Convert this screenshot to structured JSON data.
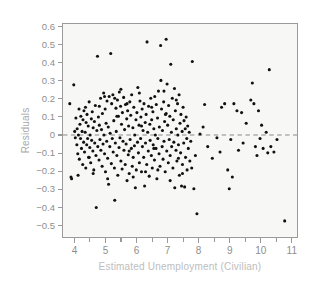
{
  "chart_data": {
    "type": "scatter",
    "title": "",
    "xlabel": "Estimated Unemployment (Civilian)",
    "ylabel": "Residuals",
    "xlim": [
      3.6,
      11.2
    ],
    "ylim": [
      -0.57,
      0.62
    ],
    "grid": false,
    "legend": null,
    "x_ticks": [
      4,
      5,
      6,
      7,
      8,
      9,
      10,
      11
    ],
    "x_tick_labels": [
      "4",
      "5",
      "6",
      "7",
      "8",
      "9",
      "10",
      "11"
    ],
    "x_minor_ticks": [
      4.5,
      5.5,
      6.5,
      7.5,
      8.5,
      9.5,
      10.5
    ],
    "y_ticks": [
      0.6,
      0.5,
      0.4,
      0.3,
      0.2,
      0.1,
      0,
      -0.1,
      -0.2,
      -0.3,
      -0.4,
      -0.5
    ],
    "y_tick_labels": [
      "0.6",
      "0.5",
      "0.4",
      "0.3",
      "0.2",
      "0.1",
      "0",
      "−0.1",
      "−0.2",
      "−0.3",
      "−0.4",
      "−0.5"
    ],
    "reference_line": {
      "name": "zero-residual-line",
      "orientation": "horizontal",
      "y": 0,
      "style": "dashed",
      "color": "#8a8a8a"
    },
    "marker": {
      "shape": "circle",
      "color": "#111111",
      "size_px": 3.1
    },
    "point_count": 286,
    "points": [
      [
        3.82,
        0.175
      ],
      [
        3.86,
        -0.235
      ],
      [
        3.88,
        -0.245
      ],
      [
        3.95,
        0.28
      ],
      [
        3.98,
        0.02
      ],
      [
        4.0,
        -0.015
      ],
      [
        4.02,
        0.095
      ],
      [
        4.05,
        -0.055
      ],
      [
        4.06,
        0.035
      ],
      [
        4.08,
        -0.105
      ],
      [
        4.1,
        0.0
      ],
      [
        4.12,
        0.145
      ],
      [
        4.13,
        -0.135
      ],
      [
        4.15,
        0.06
      ],
      [
        4.17,
        -0.02
      ],
      [
        4.18,
        0.105
      ],
      [
        4.2,
        -0.075
      ],
      [
        4.22,
        0.02
      ],
      [
        4.24,
        -0.165
      ],
      [
        4.25,
        0.085
      ],
      [
        4.27,
        -0.04
      ],
      [
        4.28,
        0.135
      ],
      [
        4.3,
        -0.095
      ],
      [
        4.32,
        0.015
      ],
      [
        4.34,
        -0.185
      ],
      [
        4.35,
        0.07
      ],
      [
        4.37,
        -0.055
      ],
      [
        4.38,
        0.115
      ],
      [
        4.4,
        -0.02
      ],
      [
        4.42,
        0.05
      ],
      [
        4.43,
        -0.125
      ],
      [
        4.45,
        0.185
      ],
      [
        4.47,
        -0.07
      ],
      [
        4.48,
        0.0
      ],
      [
        4.5,
        -0.155
      ],
      [
        4.52,
        0.09
      ],
      [
        4.53,
        -0.03
      ],
      [
        4.55,
        0.13
      ],
      [
        4.57,
        -0.09
      ],
      [
        4.58,
        0.04
      ],
      [
        4.6,
        -0.195
      ],
      [
        4.62,
        0.075
      ],
      [
        4.63,
        -0.045
      ],
      [
        4.65,
        0.165
      ],
      [
        4.67,
        -0.115
      ],
      [
        4.68,
        -0.405
      ],
      [
        4.7,
        0.025
      ],
      [
        4.72,
        0.44
      ],
      [
        4.73,
        -0.065
      ],
      [
        4.75,
        0.1
      ],
      [
        4.77,
        -0.14
      ],
      [
        4.78,
        0.055
      ],
      [
        4.8,
        -0.025
      ],
      [
        4.82,
        0.205
      ],
      [
        4.83,
        -0.085
      ],
      [
        4.85,
        0.03
      ],
      [
        4.87,
        -0.175
      ],
      [
        4.88,
        0.12
      ],
      [
        4.9,
        -0.05
      ],
      [
        4.92,
        0.235
      ],
      [
        4.93,
        0.0
      ],
      [
        4.95,
        -0.105
      ],
      [
        4.97,
        0.145
      ],
      [
        4.98,
        -0.205
      ],
      [
        5.0,
        0.065
      ],
      [
        5.02,
        -0.035
      ],
      [
        5.03,
        0.19
      ],
      [
        5.05,
        -0.13
      ],
      [
        5.07,
        0.045
      ],
      [
        5.08,
        -0.275
      ],
      [
        5.1,
        0.215
      ],
      [
        5.12,
        -0.065
      ],
      [
        5.13,
        0.01
      ],
      [
        5.15,
        0.455
      ],
      [
        5.17,
        -0.16
      ],
      [
        5.18,
        0.175
      ],
      [
        5.2,
        -0.02
      ],
      [
        5.22,
        0.225
      ],
      [
        5.23,
        -0.095
      ],
      [
        5.25,
        0.08
      ],
      [
        5.27,
        -0.185
      ],
      [
        5.28,
        0.205
      ],
      [
        5.3,
        -0.045
      ],
      [
        5.32,
        0.15
      ],
      [
        5.33,
        0.02
      ],
      [
        5.35,
        -0.115
      ],
      [
        5.37,
        0.195
      ],
      [
        5.38,
        -0.225
      ],
      [
        5.4,
        0.105
      ],
      [
        5.42,
        -0.07
      ],
      [
        5.43,
        0.24
      ],
      [
        5.45,
        -0.015
      ],
      [
        5.47,
        0.16
      ],
      [
        5.48,
        -0.145
      ],
      [
        5.5,
        0.06
      ],
      [
        5.52,
        -0.19
      ],
      [
        5.53,
        0.125
      ],
      [
        5.55,
        -0.035
      ],
      [
        5.57,
        0.21
      ],
      [
        5.58,
        -0.085
      ],
      [
        5.6,
        0.03
      ],
      [
        5.62,
        -0.165
      ],
      [
        5.63,
        0.17
      ],
      [
        5.65,
        -0.05
      ],
      [
        5.67,
        0.09
      ],
      [
        5.68,
        -0.255
      ],
      [
        5.7,
        0.135
      ],
      [
        5.72,
        -0.11
      ],
      [
        5.73,
        0.05
      ],
      [
        5.75,
        -0.215
      ],
      [
        5.77,
        0.185
      ],
      [
        5.78,
        -0.025
      ],
      [
        5.8,
        0.11
      ],
      [
        5.82,
        -0.075
      ],
      [
        5.83,
        0.225
      ],
      [
        5.85,
        -0.175
      ],
      [
        5.87,
        0.04
      ],
      [
        5.88,
        -0.125
      ],
      [
        5.9,
        0.155
      ],
      [
        5.92,
        -0.06
      ],
      [
        5.93,
        0.0
      ],
      [
        5.95,
        -0.295
      ],
      [
        5.97,
        0.085
      ],
      [
        5.98,
        -0.195
      ],
      [
        6.0,
        0.125
      ],
      [
        6.02,
        -0.04
      ],
      [
        6.03,
        0.265
      ],
      [
        6.05,
        -0.1
      ],
      [
        6.07,
        0.055
      ],
      [
        6.08,
        -0.155
      ],
      [
        6.1,
        0.19
      ],
      [
        6.12,
        -0.02
      ],
      [
        6.13,
        0.1
      ],
      [
        6.15,
        -0.205
      ],
      [
        6.17,
        0.145
      ],
      [
        6.18,
        -0.065
      ],
      [
        6.2,
        0.025
      ],
      [
        6.22,
        -0.125
      ],
      [
        6.23,
        0.175
      ],
      [
        6.25,
        -0.285
      ],
      [
        6.27,
        0.07
      ],
      [
        6.28,
        -0.045
      ],
      [
        6.3,
        0.115
      ],
      [
        6.32,
        -0.165
      ],
      [
        6.33,
        0.52
      ],
      [
        6.35,
        0.015
      ],
      [
        6.37,
        -0.09
      ],
      [
        6.38,
        0.16
      ],
      [
        6.4,
        -0.23
      ],
      [
        6.42,
        0.06
      ],
      [
        6.43,
        -0.03
      ],
      [
        6.45,
        0.205
      ],
      [
        6.47,
        -0.115
      ],
      [
        6.48,
        0.085
      ],
      [
        6.5,
        -0.185
      ],
      [
        6.52,
        0.13
      ],
      [
        6.53,
        -0.055
      ],
      [
        6.55,
        0.035
      ],
      [
        6.57,
        -0.14
      ],
      [
        6.58,
        0.215
      ],
      [
        6.6,
        0.0
      ],
      [
        6.62,
        -0.075
      ],
      [
        6.63,
        0.17
      ],
      [
        6.65,
        -0.245
      ],
      [
        6.67,
        0.095
      ],
      [
        6.68,
        -0.02
      ],
      [
        6.7,
        0.245
      ],
      [
        6.72,
        -0.105
      ],
      [
        6.73,
        0.045
      ],
      [
        6.75,
        -0.175
      ],
      [
        6.77,
        0.5
      ],
      [
        6.78,
        0.305
      ],
      [
        6.8,
        0.145
      ],
      [
        6.82,
        -0.065
      ],
      [
        6.83,
        0.025
      ],
      [
        6.85,
        -0.135
      ],
      [
        6.87,
        0.185
      ],
      [
        6.88,
        -0.035
      ],
      [
        6.9,
        0.075
      ],
      [
        6.92,
        -0.205
      ],
      [
        6.93,
        0.115
      ],
      [
        6.95,
        0.535
      ],
      [
        6.97,
        -0.09
      ],
      [
        6.98,
        0.285
      ],
      [
        7.0,
        0.055
      ],
      [
        7.02,
        -0.155
      ],
      [
        7.03,
        0.165
      ],
      [
        7.05,
        -0.025
      ],
      [
        7.07,
        0.105
      ],
      [
        7.08,
        -0.115
      ],
      [
        7.1,
        0.395
      ],
      [
        7.12,
        0.015
      ],
      [
        7.13,
        -0.065
      ],
      [
        7.15,
        0.205
      ],
      [
        7.17,
        -0.185
      ],
      [
        7.18,
        0.085
      ],
      [
        7.2,
        -0.04
      ],
      [
        7.22,
        0.26
      ],
      [
        7.23,
        -0.295
      ],
      [
        7.25,
        0.135
      ],
      [
        7.27,
        -0.085
      ],
      [
        7.28,
        0.035
      ],
      [
        7.3,
        -0.145
      ],
      [
        7.32,
        0.175
      ],
      [
        7.33,
        0.0
      ],
      [
        7.35,
        -0.055
      ],
      [
        7.37,
        0.225
      ],
      [
        7.38,
        -0.225
      ],
      [
        7.4,
        0.065
      ],
      [
        7.42,
        -0.1
      ],
      [
        7.43,
        0.115
      ],
      [
        7.45,
        -0.285
      ],
      [
        7.47,
        0.02
      ],
      [
        7.48,
        -0.165
      ],
      [
        7.5,
        0.155
      ],
      [
        7.52,
        -0.045
      ],
      [
        7.53,
        0.08
      ],
      [
        7.55,
        -0.29
      ],
      [
        7.57,
        0.035
      ],
      [
        7.58,
        -0.125
      ],
      [
        7.6,
        0.1
      ],
      [
        7.62,
        -0.02
      ],
      [
        7.63,
        -0.195
      ],
      [
        7.65,
        0.05
      ],
      [
        7.67,
        -0.075
      ],
      [
        7.7,
        0.015
      ],
      [
        7.72,
        -0.145
      ],
      [
        7.75,
        -0.035
      ],
      [
        7.78,
        -0.185
      ],
      [
        7.8,
        0.41
      ],
      [
        7.85,
        -0.3
      ],
      [
        7.9,
        -0.115
      ],
      [
        7.95,
        -0.44
      ],
      [
        8.05,
        0.005
      ],
      [
        8.15,
        0.045
      ],
      [
        8.2,
        0.17
      ],
      [
        8.3,
        -0.065
      ],
      [
        8.45,
        -0.13
      ],
      [
        8.6,
        -0.015
      ],
      [
        8.7,
        -0.095
      ],
      [
        8.75,
        0.155
      ],
      [
        8.85,
        0.175
      ],
      [
        8.95,
        -0.195
      ],
      [
        9.0,
        -0.3
      ],
      [
        9.05,
        -0.025
      ],
      [
        9.1,
        -0.235
      ],
      [
        9.15,
        0.175
      ],
      [
        9.25,
        0.135
      ],
      [
        9.3,
        -0.085
      ],
      [
        9.4,
        0.125
      ],
      [
        9.45,
        -0.045
      ],
      [
        9.55,
        0.065
      ],
      [
        9.7,
        0.195
      ],
      [
        9.75,
        0.29
      ],
      [
        9.8,
        0.175
      ],
      [
        9.85,
        -0.065
      ],
      [
        9.9,
        -0.115
      ],
      [
        9.95,
        0.135
      ],
      [
        10.0,
        -0.02
      ],
      [
        10.05,
        0.055
      ],
      [
        10.1,
        -0.075
      ],
      [
        10.2,
        0.015
      ],
      [
        10.25,
        -0.1
      ],
      [
        10.3,
        0.365
      ],
      [
        10.35,
        -0.065
      ],
      [
        10.45,
        -0.095
      ],
      [
        10.55,
        -0.025
      ],
      [
        10.8,
        -0.48
      ],
      [
        4.09,
        -0.225
      ],
      [
        4.33,
        0.155
      ],
      [
        4.58,
        -0.215
      ],
      [
        4.78,
        0.16
      ],
      [
        5.05,
        -0.245
      ],
      [
        5.28,
        -0.365
      ],
      [
        5.48,
        0.255
      ],
      [
        5.68,
        0.175
      ],
      [
        5.88,
        -0.235
      ],
      [
        6.08,
        0.235
      ],
      [
        6.28,
        -0.205
      ],
      [
        6.48,
        0.155
      ],
      [
        6.68,
        -0.195
      ],
      [
        6.88,
        0.245
      ],
      [
        7.08,
        -0.255
      ],
      [
        7.28,
        0.195
      ],
      [
        7.48,
        -0.215
      ],
      [
        4.45,
        -0.125
      ],
      [
        4.95,
        0.215
      ],
      [
        5.35,
        0.105
      ],
      [
        5.75,
        -0.09
      ],
      [
        6.15,
        0.05
      ],
      [
        6.55,
        -0.075
      ],
      [
        6.95,
        0.12
      ],
      [
        7.35,
        -0.13
      ]
    ]
  },
  "axes": {
    "y_title": "Residuals",
    "x_title": "Estimated Unemployment (Civilian)"
  }
}
